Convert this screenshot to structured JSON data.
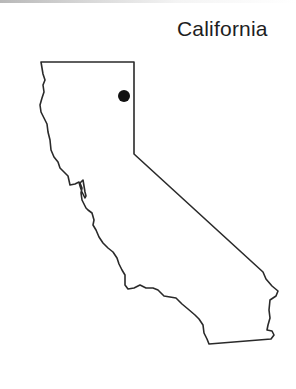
{
  "map": {
    "title": "California",
    "outline_color": "#2a2a2a",
    "marker_color": "#111111",
    "marker": {
      "shape": "filled-circle",
      "cx": 124,
      "cy": 96,
      "r": 6
    }
  }
}
